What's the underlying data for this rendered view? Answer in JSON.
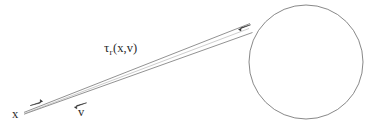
{
  "figure": {
    "kind": "geometric-diagram",
    "background_color": "#ffffff",
    "stroke_color": "#6e6e6e",
    "text_color": "#2b2b2b",
    "width": 380,
    "height": 131
  },
  "labels": {
    "tau": {
      "glyph": "τ",
      "subscript": "r",
      "arguments": "(x,v)",
      "full_text": "τr(x,v)"
    },
    "origin_point": "x",
    "direction_vector": "v"
  },
  "shapes": {
    "circle": {
      "name": "target-circle",
      "center_x": 306,
      "center_y": 62,
      "radius": 57
    },
    "beam": {
      "name": "ray-wedge",
      "apex_x": 24,
      "apex_y": 113,
      "upper_end_x": 250,
      "upper_end_y": 24,
      "lower_end_x": 252,
      "lower_end_y": 33
    },
    "arrow_to_circle": {
      "name": "forward-arrowhead",
      "tip_x": 250,
      "tip_y": 26,
      "direction": "up-right"
    },
    "arrow_back": {
      "name": "backward-arrowhead",
      "tip_x": 30,
      "tip_y": 105,
      "direction": "down-left"
    },
    "arrow_v": {
      "name": "direction-arrowhead",
      "tip_x": 86,
      "tip_y": 103,
      "direction": "up-right"
    }
  }
}
